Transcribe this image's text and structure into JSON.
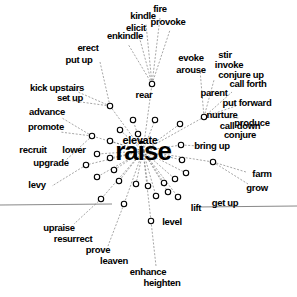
{
  "figure": {
    "title": "raise",
    "type": "semantic-network-graph",
    "center_word": "raise",
    "overlay_word": "elevate"
  },
  "colors": {
    "background": "#ffffff",
    "text": "#000000",
    "edge": "#6a6a6a",
    "node_stroke": "#000000",
    "node_fill": "#ffffff",
    "axis_line": "#555555"
  },
  "chart_data": {
    "type": "scatter",
    "title": "raise",
    "xlabel": "",
    "ylabel": "",
    "grid": false,
    "legend": false,
    "xlim": [
      0,
      297
    ],
    "ylim": [
      0,
      297
    ],
    "center": {
      "label": "raise",
      "x": 143,
      "y": 151
    },
    "labels": [
      {
        "text": "fire",
        "x": 160,
        "y": 9,
        "size": 10
      },
      {
        "text": "kindle",
        "x": 143,
        "y": 16,
        "size": 10
      },
      {
        "text": "provoke",
        "x": 168,
        "y": 22,
        "size": 10
      },
      {
        "text": "elicit",
        "x": 136,
        "y": 28,
        "size": 10
      },
      {
        "text": "enkindle",
        "x": 125,
        "y": 36,
        "size": 10
      },
      {
        "text": "erect",
        "x": 88,
        "y": 48,
        "size": 10
      },
      {
        "text": "put up",
        "x": 79,
        "y": 60,
        "size": 10
      },
      {
        "text": "evoke",
        "x": 191,
        "y": 58,
        "size": 10
      },
      {
        "text": "arouse",
        "x": 191,
        "y": 70,
        "size": 10
      },
      {
        "text": "stir",
        "x": 225,
        "y": 55,
        "size": 10
      },
      {
        "text": "invoke",
        "x": 229,
        "y": 65,
        "size": 10
      },
      {
        "text": "conjure up",
        "x": 241,
        "y": 75,
        "size": 10
      },
      {
        "text": "call forth",
        "x": 248,
        "y": 84,
        "size": 10
      },
      {
        "text": "rear",
        "x": 144,
        "y": 95,
        "size": 10
      },
      {
        "text": "kick upstairs",
        "x": 57,
        "y": 88,
        "size": 10
      },
      {
        "text": "set up",
        "x": 70,
        "y": 98,
        "size": 10
      },
      {
        "text": "parent",
        "x": 214,
        "y": 93,
        "size": 10
      },
      {
        "text": "put forward",
        "x": 247,
        "y": 103,
        "size": 10
      },
      {
        "text": "advance",
        "x": 47,
        "y": 112,
        "size": 10
      },
      {
        "text": "nurture",
        "x": 222,
        "y": 115,
        "size": 10
      },
      {
        "text": "promote",
        "x": 46,
        "y": 127,
        "size": 10
      },
      {
        "text": "produce",
        "x": 252,
        "y": 123,
        "size": 10
      },
      {
        "text": "call down",
        "x": 240,
        "y": 126,
        "size": 10
      },
      {
        "text": "conjure",
        "x": 240,
        "y": 135,
        "size": 10
      },
      {
        "text": "lower",
        "x": 74,
        "y": 150,
        "size": 10
      },
      {
        "text": "recruit",
        "x": 33,
        "y": 150,
        "size": 10
      },
      {
        "text": "upgrade",
        "x": 51,
        "y": 163,
        "size": 10
      },
      {
        "text": "bring up",
        "x": 212,
        "y": 146,
        "size": 10
      },
      {
        "text": "levy",
        "x": 37,
        "y": 185,
        "size": 10
      },
      {
        "text": "farm",
        "x": 262,
        "y": 174,
        "size": 10
      },
      {
        "text": "grow",
        "x": 257,
        "y": 188,
        "size": 10
      },
      {
        "text": "lift",
        "x": 196,
        "y": 208,
        "size": 10
      },
      {
        "text": "get up",
        "x": 225,
        "y": 203,
        "size": 10
      },
      {
        "text": "level",
        "x": 172,
        "y": 222,
        "size": 10
      },
      {
        "text": "upraise",
        "x": 59,
        "y": 228,
        "size": 10
      },
      {
        "text": "resurrect",
        "x": 73,
        "y": 239,
        "size": 10
      },
      {
        "text": "prove",
        "x": 98,
        "y": 250,
        "size": 10
      },
      {
        "text": "leaven",
        "x": 114,
        "y": 261,
        "size": 10
      },
      {
        "text": "enhance",
        "x": 148,
        "y": 272,
        "size": 10
      },
      {
        "text": "heighten",
        "x": 162,
        "y": 283,
        "size": 10
      }
    ],
    "nodes": [
      {
        "x": 152,
        "y": 84
      },
      {
        "x": 110,
        "y": 106
      },
      {
        "x": 133,
        "y": 120
      },
      {
        "x": 155,
        "y": 120
      },
      {
        "x": 180,
        "y": 124
      },
      {
        "x": 204,
        "y": 117
      },
      {
        "x": 120,
        "y": 130
      },
      {
        "x": 138,
        "y": 134
      },
      {
        "x": 92,
        "y": 136
      },
      {
        "x": 110,
        "y": 141
      },
      {
        "x": 181,
        "y": 145
      },
      {
        "x": 97,
        "y": 154
      },
      {
        "x": 213,
        "y": 162
      },
      {
        "x": 110,
        "y": 158
      },
      {
        "x": 86,
        "y": 165
      },
      {
        "x": 182,
        "y": 160
      },
      {
        "x": 114,
        "y": 170
      },
      {
        "x": 186,
        "y": 173
      },
      {
        "x": 97,
        "y": 177
      },
      {
        "x": 119,
        "y": 181
      },
      {
        "x": 136,
        "y": 184
      },
      {
        "x": 148,
        "y": 186
      },
      {
        "x": 164,
        "y": 183
      },
      {
        "x": 175,
        "y": 179
      },
      {
        "x": 101,
        "y": 199
      },
      {
        "x": 124,
        "y": 204
      },
      {
        "x": 156,
        "y": 196
      },
      {
        "x": 168,
        "y": 192
      },
      {
        "x": 178,
        "y": 197
      },
      {
        "x": 151,
        "y": 221
      }
    ]
  }
}
